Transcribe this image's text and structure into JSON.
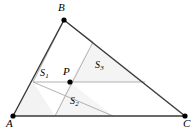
{
  "figure": {
    "type": "geometry-diagram",
    "background_color": "#ffffff",
    "outline_color": "#3a3a3a",
    "inner_line_color": "#a8a8a8",
    "point_color": "#000000",
    "label_color": "#000000"
  },
  "vertices": [
    {
      "name": "A",
      "label": "A",
      "x": 13,
      "y": 116,
      "label_x": 6,
      "label_y": 118
    },
    {
      "name": "B",
      "label": "B",
      "x": 64,
      "y": 20,
      "label_x": 58,
      "label_y": 2
    },
    {
      "name": "C",
      "label": "C",
      "x": 185,
      "y": 116,
      "label_x": 183,
      "label_y": 118
    }
  ],
  "interior_point": {
    "name": "P",
    "label": "P",
    "x": 70,
    "y": 82,
    "label_x": 63,
    "label_y": 66
  },
  "region_labels": [
    {
      "name": "S1",
      "base": "S",
      "sub": "1",
      "x": 40,
      "y": 68
    },
    {
      "name": "S2",
      "base": "S",
      "sub": "2",
      "x": 70,
      "y": 96
    },
    {
      "name": "S3",
      "base": "S",
      "sub": "3",
      "x": 95,
      "y": 60
    }
  ],
  "outline_edges": [
    {
      "name": "edge-AB",
      "x1": 13,
      "y1": 116,
      "x2": 64,
      "y2": 20
    },
    {
      "name": "edge-BC",
      "x1": 64,
      "y1": 20,
      "x2": 185,
      "y2": 116
    },
    {
      "name": "edge-AC",
      "x1": 13,
      "y1": 116,
      "x2": 185,
      "y2": 116
    }
  ],
  "inner_lines": [
    {
      "name": "line-horizontal-through-P",
      "x1": 33,
      "y1": 82,
      "x2": 145,
      "y2": 82
    },
    {
      "name": "line-P-to-BC",
      "x1": 55,
      "y1": 116,
      "x2": 93,
      "y2": 42
    },
    {
      "name": "line-P-to-AC-right",
      "x1": 113,
      "y1": 116,
      "x2": 33,
      "y2": 82
    },
    {
      "name": "line-upper-quad-left",
      "x1": 33,
      "y1": 82,
      "x2": 64,
      "y2": 20
    },
    {
      "name": "line-upper-quad-right",
      "x1": 93,
      "y1": 42,
      "x2": 64,
      "y2": 20
    }
  ],
  "shaded_regions": [
    {
      "name": "region-S1",
      "points": "33,82 55,116 13,116",
      "fill": "#f3f3f3"
    },
    {
      "name": "region-S2",
      "points": "70,82 113,116 55,116",
      "fill": "#f5f5f5"
    },
    {
      "name": "region-S3",
      "points": "70,82 93,42 145,82",
      "fill": "#f4f4f4"
    }
  ],
  "point_radius": 2.6
}
